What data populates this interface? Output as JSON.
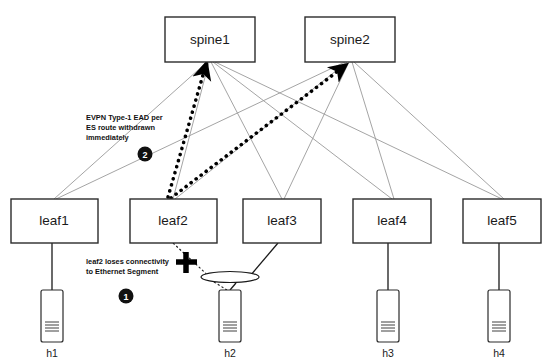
{
  "diagram": {
    "canvas": {
      "width": 557,
      "height": 364
    },
    "colors": {
      "background": "#ffffff",
      "node_stroke": "#2b2b2b",
      "fabric_link": "#9a9a9a",
      "host_link": "#1a1a1a",
      "withdraw_arrow": "#000000",
      "badge_fill": "#111111",
      "badge_text": "#ffffff"
    },
    "spines": [
      {
        "id": "spine1",
        "label": "spine1",
        "x": 165,
        "y": 17,
        "w": 90,
        "h": 45
      },
      {
        "id": "spine2",
        "label": "spine2",
        "x": 305,
        "y": 17,
        "w": 90,
        "h": 45
      }
    ],
    "leaves": [
      {
        "id": "leaf1",
        "label": "leaf1",
        "x": 11,
        "y": 199,
        "w": 87,
        "h": 44
      },
      {
        "id": "leaf2",
        "label": "leaf2",
        "x": 130,
        "y": 199,
        "w": 87,
        "h": 44
      },
      {
        "id": "leaf3",
        "label": "leaf3",
        "x": 243,
        "y": 199,
        "w": 78,
        "h": 44
      },
      {
        "id": "leaf4",
        "label": "leaf4",
        "x": 353,
        "y": 199,
        "w": 78,
        "h": 44
      },
      {
        "id": "leaf5",
        "label": "leaf5",
        "x": 463,
        "y": 199,
        "w": 78,
        "h": 44
      }
    ],
    "hosts": [
      {
        "id": "h1",
        "label": "h1",
        "x": 41,
        "y": 290,
        "w": 22,
        "h": 52
      },
      {
        "id": "h2",
        "label": "h2",
        "x": 219,
        "y": 290,
        "w": 22,
        "h": 52
      },
      {
        "id": "h3",
        "label": "h3",
        "x": 377,
        "y": 290,
        "w": 22,
        "h": 52
      },
      {
        "id": "h4",
        "label": "h4",
        "x": 488,
        "y": 290,
        "w": 22,
        "h": 52
      }
    ],
    "ethernet_segment": {
      "name": "ethernet-segment-bus",
      "cx": 230,
      "cy": 279,
      "rx": 29,
      "ry": 6
    },
    "failure_marker": {
      "name": "link-failure-cross",
      "cx": 186,
      "cy": 262,
      "size": 19
    },
    "annotations": [
      {
        "id": "anno-1",
        "badge": "1",
        "badge_cx": 126,
        "badge_cy": 296,
        "lines": [
          "leaf2 loses connectivity",
          "to Ethernet Segment"
        ],
        "text_x": 86,
        "text_y": 261
      },
      {
        "id": "anno-2",
        "badge": "2",
        "badge_cx": 145,
        "badge_cy": 154,
        "lines": [
          "EVPN Type-1 EAD per",
          "ES route withdrawn",
          "immediately"
        ],
        "text_x": 86,
        "text_y": 117
      }
    ],
    "fabric_links": [
      {
        "from": "spine1",
        "to": "leaf1"
      },
      {
        "from": "spine1",
        "to": "leaf2"
      },
      {
        "from": "spine1",
        "to": "leaf3"
      },
      {
        "from": "spine1",
        "to": "leaf4"
      },
      {
        "from": "spine1",
        "to": "leaf5"
      },
      {
        "from": "spine2",
        "to": "leaf1"
      },
      {
        "from": "spine2",
        "to": "leaf2"
      },
      {
        "from": "spine2",
        "to": "leaf3"
      },
      {
        "from": "spine2",
        "to": "leaf4"
      },
      {
        "from": "spine2",
        "to": "leaf5"
      }
    ],
    "host_links": [
      {
        "from": "leaf1",
        "to": "h1",
        "style": "solid"
      },
      {
        "from": "leaf3",
        "to": "ethernet-segment",
        "style": "solid"
      },
      {
        "from": "leaf2",
        "to": "ethernet-segment",
        "style": "dotted-failed"
      },
      {
        "from": "ethernet-segment",
        "to": "h2",
        "style": "solid"
      },
      {
        "from": "leaf4",
        "to": "h3",
        "style": "solid"
      },
      {
        "from": "leaf5",
        "to": "h4",
        "style": "solid"
      }
    ],
    "withdraw_arrows": [
      {
        "from": "leaf2",
        "to": "spine1",
        "x1": 168,
        "y1": 198,
        "x2": 205,
        "y2": 64
      },
      {
        "from": "leaf2",
        "to": "spine2",
        "x1": 170,
        "y1": 199,
        "x2": 344,
        "y2": 64
      }
    ]
  }
}
